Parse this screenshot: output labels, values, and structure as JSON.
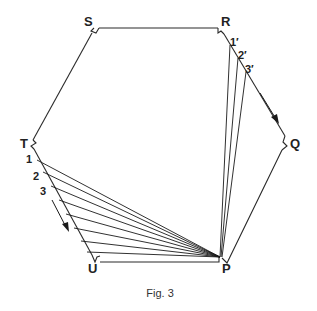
{
  "figure": {
    "caption": "Fig. 3",
    "vertices": [
      {
        "id": "S",
        "label": "S",
        "x": 95,
        "y": 28,
        "lx": 84,
        "ly": 26
      },
      {
        "id": "R",
        "label": "R",
        "x": 222,
        "y": 28,
        "lx": 221,
        "ly": 26
      },
      {
        "id": "Q",
        "label": "Q",
        "x": 286,
        "y": 143,
        "lx": 290,
        "ly": 148
      },
      {
        "id": "P",
        "label": "P",
        "x": 222,
        "y": 259,
        "lx": 222,
        "ly": 273
      },
      {
        "id": "U",
        "label": "U",
        "x": 94,
        "y": 260,
        "lx": 88,
        "ly": 273
      },
      {
        "id": "T",
        "label": "T",
        "x": 33,
        "y": 143,
        "lx": 20,
        "ly": 148
      }
    ],
    "left_fan_labels": [
      {
        "text": "1",
        "x": 26,
        "y": 163
      },
      {
        "text": "2",
        "x": 33,
        "y": 180
      },
      {
        "text": "3",
        "x": 40,
        "y": 195
      }
    ],
    "right_fan_labels": [
      {
        "text": "1′",
        "x": 230,
        "y": 46
      },
      {
        "text": "2′",
        "x": 238,
        "y": 59
      },
      {
        "text": "3′",
        "x": 245,
        "y": 73
      }
    ],
    "colors": {
      "line": "#2a2a2a",
      "background": "#ffffff"
    }
  }
}
